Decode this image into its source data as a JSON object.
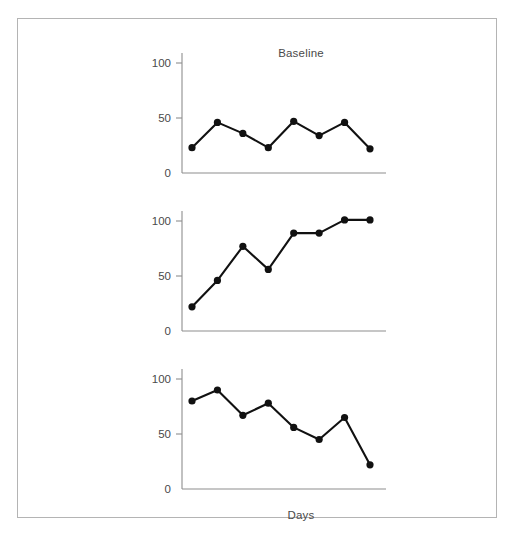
{
  "figure": {
    "title": "Baseline",
    "y_axis_label": "Percent Intervals of Inappropriate Behavior",
    "x_axis_label": "Days"
  },
  "axis": {
    "tick_0": "0",
    "tick_50": "50",
    "tick_100": "100"
  },
  "chart_data": {
    "type": "line",
    "title": "Baseline",
    "xlabel": "Days",
    "ylabel": "Percent Intervals of Inappropriate Behavior",
    "ylim": [
      0,
      110
    ],
    "yticks": [
      0,
      50,
      100
    ],
    "grid": false,
    "legend": null,
    "layout": "three stacked panels sharing x and y axes (multiple-baseline design)",
    "panels": [
      {
        "name": "top-panel",
        "title": "Baseline",
        "x": [
          1,
          2,
          3,
          4,
          5,
          6,
          7,
          8
        ],
        "values": [
          23,
          46,
          36,
          23,
          47,
          34,
          46,
          22
        ]
      },
      {
        "name": "middle-panel",
        "title": "",
        "x": [
          1,
          2,
          3,
          4,
          5,
          6,
          7,
          8
        ],
        "values": [
          22,
          46,
          77,
          56,
          89,
          89,
          101,
          101
        ]
      },
      {
        "name": "bottom-panel",
        "title": "",
        "x": [
          1,
          2,
          3,
          4,
          5,
          6,
          7,
          8
        ],
        "values": [
          80,
          90,
          67,
          78,
          56,
          45,
          65,
          22
        ]
      }
    ]
  },
  "colors": {
    "line": "#111111",
    "marker": "#111111",
    "axis": "#8e8e8e",
    "frame": "#b4b4b4",
    "text": "#4a4a4a",
    "background": "#ffffff"
  }
}
